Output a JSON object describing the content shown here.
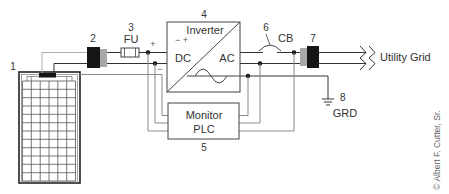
{
  "components": {
    "pv_panel": {
      "number": "1"
    },
    "dc_disconnect": {
      "number": "2"
    },
    "fuse": {
      "number": "3",
      "label": "FU"
    },
    "inverter": {
      "number": "4",
      "title": "Inverter",
      "polarity": "− +",
      "dc_label": "DC",
      "ac_label": "AC"
    },
    "monitor": {
      "number": "5",
      "line1": "Monitor",
      "line2": "PLC"
    },
    "breaker": {
      "number": "6",
      "label": "CB"
    },
    "ac_disconnect": {
      "number": "7"
    },
    "ground": {
      "number": "8",
      "label": "GRD"
    },
    "utility_grid": {
      "label": "Utility Grid"
    },
    "dc_bus": {
      "positive": "+",
      "negative": "−"
    }
  },
  "credit": "© Albert F. Cutter, Sr.",
  "colors": {
    "wire": "#333333",
    "wire_gray": "#8a8a8a",
    "connector_black": "#151515",
    "connector_gray": "#a8a8a8",
    "node": "#111111"
  }
}
